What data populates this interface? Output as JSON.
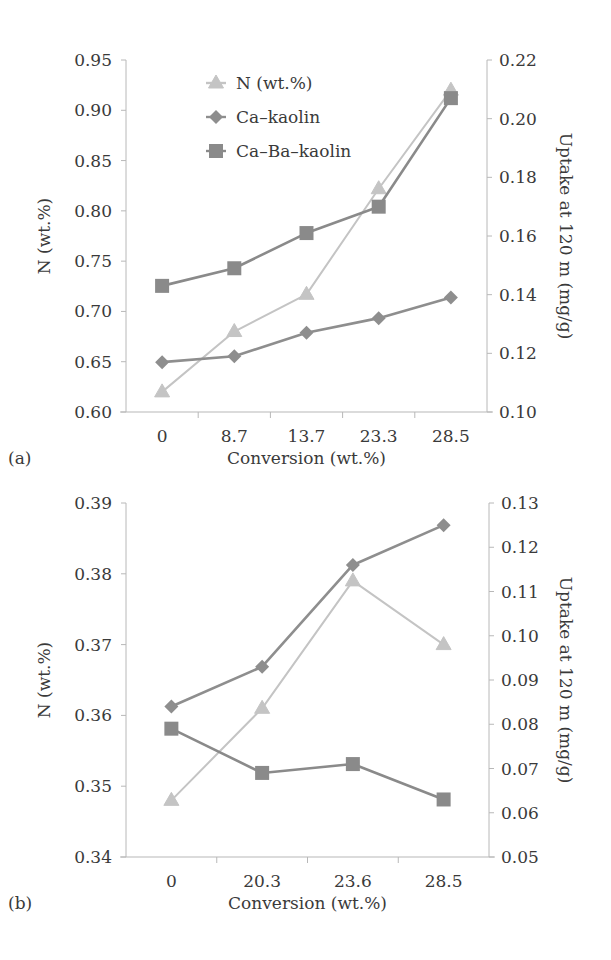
{
  "colors": {
    "axis": "#b8b8b8",
    "text": "#3a3a3a",
    "n_series": "#c4c4c4",
    "ca_kaolin": "#8e8e8e",
    "ca_ba_kaolin": "#8a8a8a"
  },
  "legend": {
    "items": [
      {
        "label": "N (wt.%)",
        "marker": "triangle-icon"
      },
      {
        "label": "Ca–kaolin",
        "marker": "diamond-icon"
      },
      {
        "label": "Ca–Ba–kaolin",
        "marker": "square-icon"
      }
    ]
  },
  "panel_a": {
    "letter": "(a)",
    "xlabel": "Conversion (wt.%)",
    "ylabel_left": "N (wt.%)",
    "ylabel_right": "Uptake at 120 m (mg/g)",
    "x_ticks": [
      "0",
      "8.7",
      "13.7",
      "23.3",
      "28.5"
    ],
    "y_left_ticks": [
      "0.60",
      "0.65",
      "0.70",
      "0.75",
      "0.80",
      "0.85",
      "0.90",
      "0.95"
    ],
    "y_right_ticks": [
      "0.10",
      "0.12",
      "0.14",
      "0.16",
      "0.18",
      "0.20",
      "0.22"
    ]
  },
  "panel_b": {
    "letter": "(b)",
    "xlabel": "Conversion (wt.%)",
    "ylabel_left": "N (wt.%)",
    "ylabel_right": "Uptake at 120 m (mg/g)",
    "x_ticks": [
      "0",
      "20.3",
      "23.6",
      "28.5"
    ],
    "y_left_ticks": [
      "0.34",
      "0.35",
      "0.36",
      "0.37",
      "0.38",
      "0.39"
    ],
    "y_right_ticks": [
      "0.05",
      "0.06",
      "0.07",
      "0.08",
      "0.09",
      "0.10",
      "0.11",
      "0.12",
      "0.13"
    ]
  },
  "chart_data": [
    {
      "type": "line",
      "title": "(a)",
      "xlabel": "Conversion (wt.%)",
      "ylabel": "N (wt.%)",
      "ylabel_right": "Uptake at 120 m (mg/g)",
      "categories": [
        "0",
        "8.7",
        "13.7",
        "23.3",
        "28.5"
      ],
      "ylim": [
        0.6,
        0.95
      ],
      "ylim_right": [
        0.1,
        0.22
      ],
      "grid": false,
      "legend_position": "upper-left inside",
      "series": [
        {
          "name": "N (wt.%)",
          "axis": "left",
          "marker": "triangle",
          "values": [
            0.62,
            0.68,
            0.717,
            0.822,
            0.92
          ]
        },
        {
          "name": "Ca–kaolin",
          "axis": "right",
          "marker": "diamond",
          "values": [
            0.117,
            0.119,
            0.127,
            0.132,
            0.139
          ]
        },
        {
          "name": "Ca–Ba–kaolin",
          "axis": "right",
          "marker": "square",
          "values": [
            0.143,
            0.149,
            0.161,
            0.17,
            0.207
          ]
        }
      ]
    },
    {
      "type": "line",
      "title": "(b)",
      "xlabel": "Conversion (wt.%)",
      "ylabel": "N (wt.%)",
      "ylabel_right": "Uptake at 120 m (mg/g)",
      "categories": [
        "0",
        "20.3",
        "23.6",
        "28.5"
      ],
      "ylim": [
        0.34,
        0.39
      ],
      "ylim_right": [
        0.05,
        0.13
      ],
      "grid": false,
      "series": [
        {
          "name": "N (wt.%)",
          "axis": "left",
          "marker": "triangle",
          "values": [
            0.348,
            0.361,
            0.379,
            0.37
          ]
        },
        {
          "name": "Ca–kaolin",
          "axis": "right",
          "marker": "diamond",
          "values": [
            0.084,
            0.093,
            0.116,
            0.125
          ]
        },
        {
          "name": "Ca–Ba–kaolin",
          "axis": "right",
          "marker": "square",
          "values": [
            0.079,
            0.069,
            0.071,
            0.063
          ]
        }
      ]
    }
  ]
}
